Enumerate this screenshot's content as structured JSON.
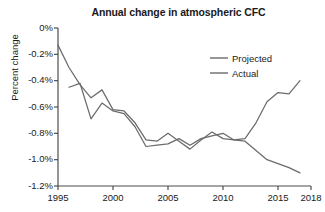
{
  "chart_data": {
    "type": "line",
    "title": "Annual change in atmospheric CFC",
    "xlabel": "",
    "ylabel": "Percent change",
    "xlim": [
      1995,
      2018
    ],
    "ylim": [
      -1.2,
      0
    ],
    "grid": false,
    "legend_position": "top-right",
    "x_ticks": [
      1995,
      2000,
      2005,
      2010,
      2015,
      2018
    ],
    "x_tick_labels": [
      "1995",
      "2000",
      "2005",
      "2010",
      "2015",
      "2018"
    ],
    "y_ticks": [
      0,
      -0.2,
      -0.4,
      -0.6,
      -0.8,
      -1.0,
      -1.2
    ],
    "y_tick_labels": [
      "0%",
      "-0.2%",
      "-0.4%",
      "-0.6%",
      "-0.8%",
      "-1.0%",
      "-1.2%"
    ],
    "series": [
      {
        "name": "Projected",
        "color": "#6b6b6b",
        "x": [
          1995,
          1996,
          1997,
          1998,
          1999,
          2000,
          2001,
          2002,
          2003,
          2004,
          2005,
          2006,
          2007,
          2008,
          2009,
          2010,
          2011,
          2012,
          2013,
          2014,
          2015,
          2016,
          2017
        ],
        "y": [
          -0.13,
          -0.3,
          -0.43,
          -0.53,
          -0.47,
          -0.62,
          -0.63,
          -0.72,
          -0.85,
          -0.86,
          -0.8,
          -0.86,
          -0.92,
          -0.85,
          -0.79,
          -0.84,
          -0.85,
          -0.84,
          -0.72,
          -0.56,
          -0.49,
          -0.5,
          -0.4
        ]
      },
      {
        "name": "Actual",
        "color": "#6b6b6b",
        "x": [
          1996,
          1997,
          1998,
          1999,
          2000,
          2001,
          2002,
          2003,
          2004,
          2005,
          2006,
          2007,
          2008,
          2009,
          2010,
          2011,
          2012,
          2013,
          2014,
          2015,
          2016,
          2017
        ],
        "y": [
          -0.45,
          -0.42,
          -0.69,
          -0.57,
          -0.63,
          -0.65,
          -0.75,
          -0.9,
          -0.89,
          -0.88,
          -0.84,
          -0.89,
          -0.84,
          -0.82,
          -0.8,
          -0.85,
          -0.86,
          -0.93,
          -1.0,
          -1.03,
          -1.06,
          -1.1
        ]
      }
    ]
  },
  "legend": {
    "items": [
      {
        "label": "Projected"
      },
      {
        "label": "Actual"
      }
    ]
  }
}
